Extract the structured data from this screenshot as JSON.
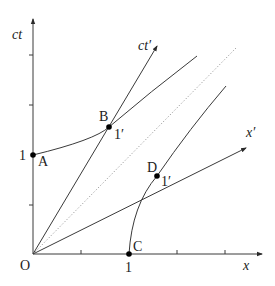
{
  "diagram": {
    "axes": {
      "ct_label": "ct",
      "x_label": "x",
      "ct_prime_label": "ct′",
      "x_prime_label": "x′",
      "origin_label": "O"
    },
    "tick_labels": {
      "ct_unit": "1",
      "x_unit": "1"
    },
    "points": [
      {
        "id": "A",
        "label": "A",
        "unit_label": ""
      },
      {
        "id": "B",
        "label": "B",
        "unit_label": "1′"
      },
      {
        "id": "C",
        "label": "C",
        "unit_label": ""
      },
      {
        "id": "D",
        "label": "D",
        "unit_label": "1′"
      }
    ],
    "colors": {
      "line": "#3a3a3a",
      "dotted_light_line": "#9a9a9a",
      "point": "#000000",
      "background": "#ffffff"
    }
  }
}
